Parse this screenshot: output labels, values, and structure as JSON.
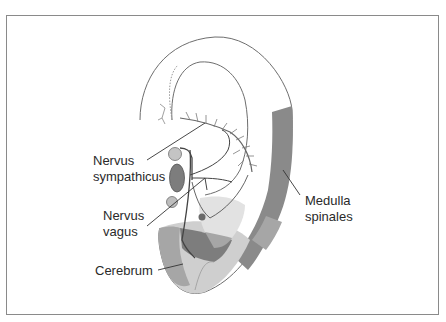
{
  "diagram": {
    "labels": {
      "nervus_sympathicus": [
        "Nervus",
        "sympathicus"
      ],
      "nervus_vagus": [
        "Nervus",
        "vagus"
      ],
      "medulla_spinales": [
        "Medulla",
        "spinales"
      ],
      "cerebrum": "Cerebrum"
    },
    "colors": {
      "outline": "#6e6e6e",
      "zone_dark": "#7d7d7d",
      "zone_mid": "#a6a6a6",
      "zone_light": "#cfcfcf",
      "zone_pale": "#e2e2e2",
      "text": "#2a2a2a",
      "frame": "#8a8a8a"
    }
  }
}
